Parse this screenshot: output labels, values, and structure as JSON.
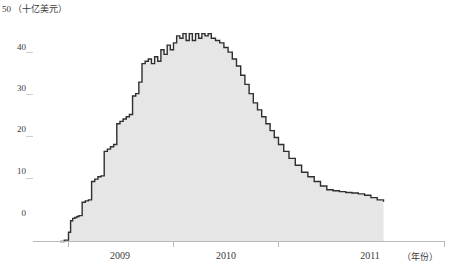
{
  "chart_data": {
    "type": "area",
    "title": "",
    "xlabel": "（年份）",
    "ylabel": "（十亿美元）",
    "ylim": [
      0,
      50
    ],
    "grid": false,
    "legend": "none",
    "y_ticks": [
      "0",
      "10",
      "20",
      "30",
      "40",
      "50"
    ],
    "y_tick_values": [
      0,
      10,
      20,
      30,
      40,
      50
    ],
    "x_ticks": [
      "2009",
      "2010",
      "2011"
    ],
    "x_tick_values": [
      2009,
      2010,
      2011
    ],
    "fill_color": "#e6e6e6",
    "line_color": "#2f2f2f",
    "axis_color": "#b9b9b9",
    "series": [
      {
        "name": "余额",
        "x": [
          2008.92,
          2008.96,
          2009.0,
          2009.02,
          2009.04,
          2009.06,
          2009.08,
          2009.1,
          2009.13,
          2009.16,
          2009.19,
          2009.22,
          2009.25,
          2009.28,
          2009.31,
          2009.34,
          2009.37,
          2009.4,
          2009.43,
          2009.46,
          2009.49,
          2009.52,
          2009.55,
          2009.58,
          2009.61,
          2009.64,
          2009.67,
          2009.7,
          2009.73,
          2009.76,
          2009.79,
          2009.82,
          2009.85,
          2009.88,
          2009.91,
          2009.94,
          2009.97,
          2010.0,
          2010.03,
          2010.06,
          2010.09,
          2010.12,
          2010.15,
          2010.18,
          2010.21,
          2010.24,
          2010.27,
          2010.3,
          2010.33,
          2010.36,
          2010.4,
          2010.44,
          2010.48,
          2010.52,
          2010.56,
          2010.6,
          2010.64,
          2010.68,
          2010.72,
          2010.76,
          2010.8,
          2010.84,
          2010.88,
          2010.92,
          2010.96,
          2011.0,
          2011.05,
          2011.1,
          2011.16,
          2011.22,
          2011.28,
          2011.34,
          2011.4,
          2011.46,
          2011.52,
          2011.58,
          2011.64,
          2011.7,
          2011.76,
          2011.82,
          2011.88,
          2011.94,
          2012.0
        ],
        "values": [
          0.0,
          0.3,
          2.0,
          4.5,
          5.0,
          5.2,
          5.4,
          5.6,
          8.5,
          8.8,
          9.0,
          13.0,
          13.5,
          14.0,
          14.2,
          19.5,
          20.0,
          20.5,
          21.0,
          25.5,
          26.0,
          26.5,
          27.0,
          27.5,
          31.5,
          32.0,
          34.5,
          38.5,
          39.0,
          39.5,
          38.5,
          40.0,
          39.0,
          41.5,
          40.5,
          42.5,
          41.5,
          43.0,
          44.5,
          44.0,
          45.0,
          43.5,
          45.0,
          43.5,
          45.0,
          44.0,
          45.0,
          44.5,
          45.0,
          44.0,
          43.5,
          43.0,
          42.0,
          41.0,
          39.5,
          38.0,
          36.0,
          34.0,
          32.0,
          30.0,
          28.5,
          27.0,
          25.5,
          24.0,
          22.5,
          21.0,
          19.5,
          18.0,
          16.5,
          15.0,
          14.0,
          13.0,
          12.0,
          11.2,
          11.0,
          10.8,
          10.6,
          10.5,
          10.3,
          10.0,
          9.5,
          9.0,
          8.6
        ]
      }
    ]
  }
}
